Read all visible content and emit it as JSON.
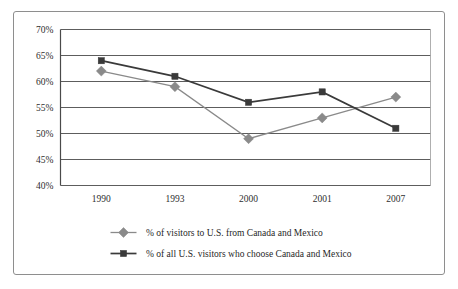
{
  "chart_data": {
    "type": "line",
    "title": "",
    "subtitle": "",
    "xlabel": "",
    "ylabel": "",
    "categories": [
      "1990",
      "1993",
      "2000",
      "2001",
      "2007"
    ],
    "ylim": [
      40,
      70
    ],
    "ytick_values": [
      40,
      45,
      50,
      55,
      60,
      65,
      70
    ],
    "ytick_labels": [
      "40%",
      "45%",
      "50%",
      "55%",
      "60%",
      "65%",
      "70%"
    ],
    "grid": true,
    "grid_axis": "y",
    "legend_position": "bottom",
    "series": [
      {
        "name": "% of visitors to U.S. from Canada and Mexico",
        "values": [
          62,
          59,
          49,
          53,
          57
        ],
        "color": "#8a8a8a",
        "marker": "diamond"
      },
      {
        "name": "% of all U.S. visitors who choose Canada and Mexico",
        "values": [
          64,
          61,
          56,
          58,
          51
        ],
        "color": "#3a3a3a",
        "marker": "square"
      }
    ],
    "annotations": []
  },
  "axis": {
    "ytick_labels": [
      "70%",
      "65%",
      "60%",
      "55%",
      "50%",
      "45%",
      "40%"
    ],
    "xtick_labels": [
      "1990",
      "1993",
      "2000",
      "2001",
      "2007"
    ]
  },
  "legend": {
    "entries": [
      {
        "label": "% of visitors to U.S. from Canada and Mexico",
        "color": "#8a8a8a",
        "marker": "diamond"
      },
      {
        "label": "% of all U.S. visitors who choose Canada and Mexico",
        "color": "#3a3a3a",
        "marker": "square"
      }
    ]
  },
  "colors": {
    "series_light": "#8a8a8a",
    "series_dark": "#3a3a3a",
    "grid": "#5d5d5d",
    "axis": "#4a4a4a",
    "frame": "#8e8e8e",
    "background": "#ffffff"
  }
}
